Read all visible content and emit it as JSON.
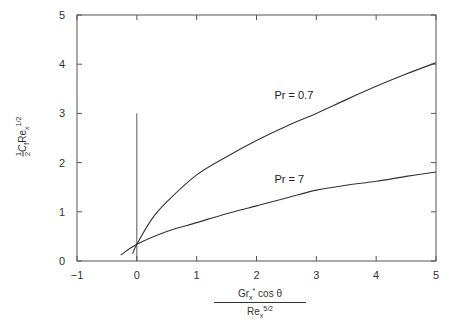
{
  "chart_data": {
    "type": "line",
    "title": "",
    "xlabel": "Gr_x* cos θ / Re_x^(5/2)",
    "ylabel": "½ C_f Re_x^(1/2)",
    "xlim": [
      -1,
      5
    ],
    "ylim": [
      0,
      5
    ],
    "x_ticks": [
      -1,
      0,
      1,
      2,
      3,
      4,
      5
    ],
    "y_ticks": [
      0,
      1,
      2,
      3,
      4,
      5
    ],
    "grid": false,
    "legend": "inline curve labels",
    "reference_line": {
      "x": 0,
      "y_from": 0,
      "y_to": 3
    },
    "series": [
      {
        "name": "Pr = 0.7",
        "x": [
          -0.07,
          0,
          0.25,
          0.5,
          1,
          1.5,
          2,
          2.5,
          3,
          3.5,
          4,
          4.5,
          5
        ],
        "y": [
          0.15,
          0.34,
          0.85,
          1.2,
          1.75,
          2.12,
          2.45,
          2.74,
          3.0,
          3.28,
          3.55,
          3.8,
          4.03
        ]
      },
      {
        "name": "Pr = 7",
        "x": [
          -0.27,
          0,
          0.5,
          1,
          1.5,
          2,
          2.5,
          3,
          3.5,
          4,
          4.5,
          5
        ],
        "y": [
          0.12,
          0.34,
          0.6,
          0.78,
          0.96,
          1.12,
          1.28,
          1.44,
          1.54,
          1.62,
          1.72,
          1.81
        ]
      }
    ],
    "annotations": [
      {
        "text": "Pr = 0.7",
        "x": 2.3,
        "y": 3.3
      },
      {
        "text": "Pr = 7",
        "x": 2.3,
        "y": 1.58
      }
    ]
  },
  "labels": {
    "pr07": "Pr = 0.7",
    "pr7": "Pr = 7",
    "x_num_main": "Gr",
    "x_num_sub": "x",
    "x_num_sup": "*",
    "x_num_rest": " cos θ",
    "x_den_main": "Re",
    "x_den_sub": "x",
    "x_den_sup": "5/2",
    "y_frac_top": "1",
    "y_frac_bot": "2",
    "y_c": "C",
    "y_c_sub": "f",
    "y_re": "Re",
    "y_re_sub": "x",
    "y_re_sup": "1/2"
  }
}
